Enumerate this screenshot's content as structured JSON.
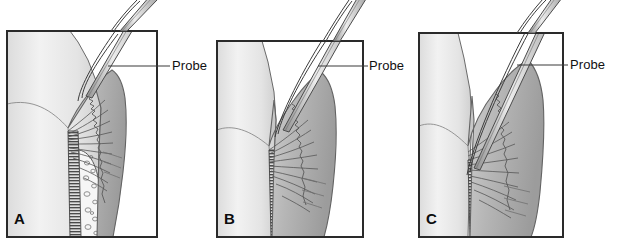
{
  "figure": {
    "type": "medical-illustration",
    "background_color": "#ffffff",
    "panel_border_color": "#2a2a2a",
    "leader_line_color": "#3a3a3a",
    "tooth_color": "#e9e9e9",
    "gingiva_color": "#b9b9b9",
    "bone_color": "#f4f4f4",
    "pdl_color": "#d8d8d8",
    "probe_color": "#d5d5d5",
    "panels": [
      {
        "id": "A",
        "letter": "A",
        "label": "Probe",
        "probe_depth": "shallow",
        "description": "Probe tip rests at the base of a healthy gingival sulcus"
      },
      {
        "id": "B",
        "letter": "B",
        "label": "Probe",
        "probe_depth": "moderate",
        "description": "Probe tip penetrates into an inflamed, deepened pocket"
      },
      {
        "id": "C",
        "letter": "C",
        "label": "Probe",
        "probe_depth": "deep",
        "description": "Probe tip extends apically past the alveolar bone crest"
      }
    ]
  }
}
